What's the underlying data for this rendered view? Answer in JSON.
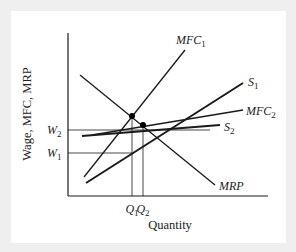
{
  "diagram": {
    "type": "labor-market-monopsony",
    "y_axis_label": "Wage, MFC, MRP",
    "x_axis_label": "Quantity",
    "y_ticks": [
      {
        "main": "W",
        "sub": "2",
        "y": 130
      },
      {
        "main": "W",
        "sub": "1",
        "y": 153
      }
    ],
    "x_ticks": [
      {
        "main": "Q",
        "sub": "1",
        "x": 132
      },
      {
        "main": "Q",
        "sub": "2",
        "x": 143
      }
    ],
    "curves": [
      {
        "id": "MFC1",
        "main": "MFC",
        "sub": "1",
        "x1": 84,
        "y1": 177,
        "x2": 185,
        "y2": 50,
        "width": 1.3,
        "label_x": 176,
        "label_y": 44
      },
      {
        "id": "MRP",
        "main": "MRP",
        "sub": "",
        "x1": 80,
        "y1": 75,
        "x2": 215,
        "y2": 185,
        "width": 1.3,
        "label_x": 219,
        "label_y": 190
      },
      {
        "id": "S1",
        "main": "S",
        "sub": "1",
        "x1": 86,
        "y1": 183,
        "x2": 243,
        "y2": 83,
        "width": 2.0,
        "label_x": 248,
        "label_y": 86
      },
      {
        "id": "MFC2",
        "main": "MFC",
        "sub": "2",
        "x1": 92,
        "y1": 135,
        "x2": 243,
        "y2": 110,
        "width": 1.5,
        "label_x": 246,
        "label_y": 115
      },
      {
        "id": "S2",
        "main": "S",
        "sub": "2",
        "x1": 82,
        "y1": 136,
        "x2": 220,
        "y2": 125,
        "width": 2.0,
        "label_x": 224,
        "label_y": 131
      }
    ],
    "points": [
      {
        "id": "equilibrium-1",
        "x": 132,
        "y": 116
      },
      {
        "id": "equilibrium-2",
        "x": 143,
        "y": 125
      }
    ],
    "colors": {
      "line": "#1a1a1a",
      "background": "#ffffff",
      "frame": "#efefef"
    }
  }
}
